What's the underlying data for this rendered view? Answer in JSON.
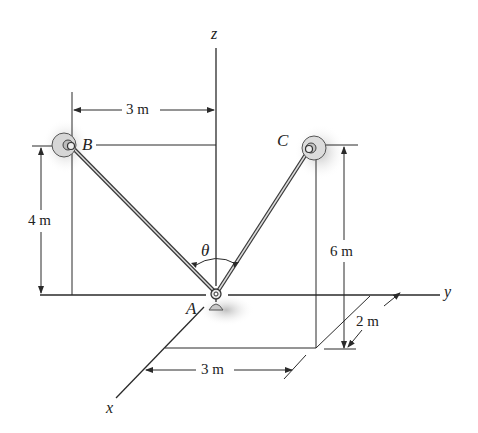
{
  "diagram": {
    "type": "3d-statics-cable-figure",
    "axes": {
      "x": "x",
      "y": "y",
      "z": "z"
    },
    "points": {
      "A": "A",
      "B": "B",
      "C": "C"
    },
    "angle_label": "θ",
    "dimensions": {
      "b_offset_y": "3 m",
      "b_height": "4 m",
      "c_height": "6 m",
      "c_offset_x": "2 m",
      "c_offset_y": "3 m"
    },
    "colors": {
      "line": "#2a2a2a",
      "cable": "#555555",
      "shadow": "#bdbdbd",
      "anchor": "#cfcfcf"
    }
  }
}
